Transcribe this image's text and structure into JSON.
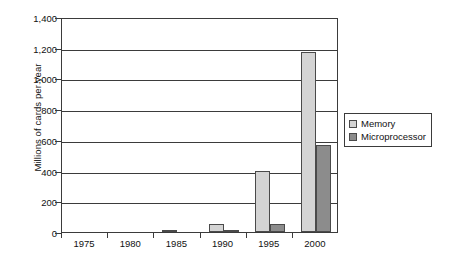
{
  "chart_data": {
    "type": "bar",
    "title": "",
    "xlabel": "",
    "ylabel": "Millions of cards per year",
    "categories": [
      "1975",
      "1980",
      "1985",
      "1990",
      "1995",
      "2000"
    ],
    "series": [
      {
        "name": "Memory",
        "color": "#d4d4d4",
        "values": [
          0,
          0,
          5,
          50,
          400,
          1175
        ]
      },
      {
        "name": "Microprocessor",
        "color": "#8c8c8c",
        "values": [
          0,
          0,
          0,
          4,
          50,
          565
        ]
      }
    ],
    "ylim": [
      0,
      1400
    ],
    "ytick_values": [
      0,
      200,
      400,
      600,
      800,
      1000,
      1200,
      1400
    ],
    "ytick_labels": [
      "0",
      "200",
      "400",
      "600",
      "800",
      "1,000",
      "1,200",
      "1,400"
    ],
    "grid": true,
    "legend_position": "right",
    "legend": [
      "Memory",
      "Microprocessor"
    ]
  },
  "legend": {
    "items": [
      {
        "label": "Memory",
        "swatch": "light-gray-swatch-icon"
      },
      {
        "label": "Microprocessor",
        "swatch": "dark-gray-swatch-icon"
      }
    ]
  },
  "colors": {
    "memory": "#d4d4d4",
    "microprocessor": "#8c8c8c",
    "axis": "#3b3b3b",
    "background": "#ffffff"
  }
}
